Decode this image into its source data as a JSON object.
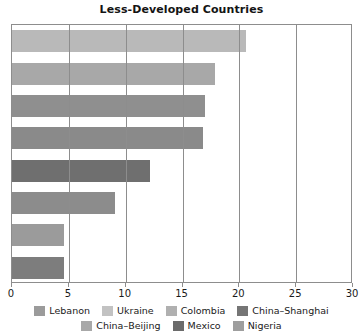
{
  "chart_data": {
    "type": "bar",
    "orientation": "horizontal",
    "title": "Less-Developed Countries",
    "xlabel": "",
    "ylabel": "",
    "xlim": [
      0,
      30
    ],
    "xticks": [
      0,
      5,
      10,
      15,
      20,
      25,
      30
    ],
    "xtick_labels": [
      "0",
      "5",
      "10",
      "15",
      "20",
      "25",
      "30"
    ],
    "grid": true,
    "grid_axis": "x",
    "legend_position": "bottom",
    "categories": [
      "Lebanon",
      "Ukraine",
      "Colombia",
      "China–Shanghai",
      "Mexico",
      "Nigeria",
      "China–Beijing",
      "China–Beijing"
    ],
    "values": [
      20.6,
      17.9,
      17.0,
      16.8,
      12.1,
      9.1,
      4.6,
      4.6
    ],
    "bar_colors": [
      "#b9b9b9",
      "#a8a8a8",
      "#8f8f8f",
      "#8a8a8a",
      "#6f6f6f",
      "#8c8c8c",
      "#9b9b9b",
      "#7d7d7d"
    ]
  },
  "legend": {
    "rows": [
      [
        {
          "label": "Lebanon",
          "color": "#9b9b9b"
        },
        {
          "label": "Ukraine",
          "color": "#c2c2c2"
        },
        {
          "label": "Colombia",
          "color": "#b0b0b0"
        },
        {
          "label": "China–Shanghai",
          "color": "#757575"
        }
      ],
      [
        {
          "label": "China–Beijing",
          "color": "#a8a8a8"
        },
        {
          "label": "Mexico",
          "color": "#6b6b6b"
        },
        {
          "label": "Nigeria",
          "color": "#9e9e9e"
        }
      ]
    ]
  },
  "colors": {
    "axis": "#8d8d8d",
    "text": "#1a1a1a",
    "background": "#ffffff"
  }
}
